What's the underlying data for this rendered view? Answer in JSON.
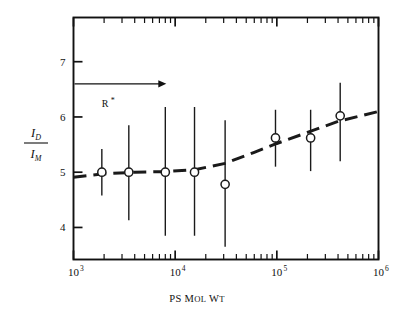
{
  "figure": {
    "background_color": "#ffffff",
    "frame_color": "#111111",
    "data_color": "#1a1a1a"
  },
  "annotation": {
    "label": "R",
    "star": "*",
    "arrow_name": "rightward-arrow"
  },
  "axes": {
    "x": {
      "title_lead": "PS",
      "title_word2_cap": "M",
      "title_word2_rest": "OL",
      "title_word3_cap": "W",
      "title_word3_rest": "T",
      "tick_labels": [
        "10",
        "10",
        "10",
        "10"
      ],
      "tick_exponents": [
        "3",
        "4",
        "5",
        "6"
      ],
      "tick_values": [
        1000,
        10000,
        100000,
        1000000
      ],
      "scale": "log",
      "range": [
        1000,
        1000000
      ]
    },
    "y": {
      "title_numerator_base": "I",
      "title_numerator_sub": "D",
      "title_denominator_base": "I",
      "title_denominator_sub": "M",
      "tick_labels": [
        "4",
        "5",
        "6",
        "7"
      ],
      "tick_values": [
        4,
        5,
        6,
        7
      ],
      "scale": "linear",
      "range": [
        3.42,
        7.8
      ]
    }
  },
  "chart_data": {
    "type": "scatter",
    "title": "",
    "xlabel": "PS MOL WT",
    "ylabel": "I_D / I_M",
    "xscale": "log",
    "yscale": "linear",
    "xlim": [
      1000,
      1000000
    ],
    "ylim": [
      3.42,
      7.8
    ],
    "grid": false,
    "legend": null,
    "marker": "open-circle",
    "errorbar_style": "plain-vertical-no-caps",
    "annotations": [
      {
        "text": "R*",
        "type": "arrow-label",
        "x": 2000,
        "y": 6.6,
        "arrow_to_x": 8000
      }
    ],
    "series": [
      {
        "name": "I_D/I_M vs PS Mol Wt",
        "points": [
          {
            "x": 1900,
            "y": 5.0,
            "yerr_low": 4.58,
            "yerr_high": 5.42
          },
          {
            "x": 3500,
            "y": 5.0,
            "yerr_low": 4.13,
            "yerr_high": 5.85
          },
          {
            "x": 8000,
            "y": 5.0,
            "yerr_low": 3.85,
            "yerr_high": 6.18
          },
          {
            "x": 15500,
            "y": 5.0,
            "yerr_low": 3.85,
            "yerr_high": 6.18
          },
          {
            "x": 31000,
            "y": 4.78,
            "yerr_low": 3.65,
            "yerr_high": 5.94
          },
          {
            "x": 97000,
            "y": 5.62,
            "yerr_low": 5.1,
            "yerr_high": 6.13
          },
          {
            "x": 215000,
            "y": 5.62,
            "yerr_low": 5.02,
            "yerr_high": 6.13
          },
          {
            "x": 420000,
            "y": 6.02,
            "yerr_low": 5.2,
            "yerr_high": 6.62
          }
        ]
      }
    ],
    "fit_curve": {
      "name": "dashed-trend-line",
      "style": "dashed",
      "points": [
        {
          "x": 1000,
          "y": 4.91
        },
        {
          "x": 2000,
          "y": 4.97
        },
        {
          "x": 4000,
          "y": 5.0
        },
        {
          "x": 8000,
          "y": 5.01
        },
        {
          "x": 16000,
          "y": 5.05
        },
        {
          "x": 31000,
          "y": 5.16
        },
        {
          "x": 60000,
          "y": 5.36
        },
        {
          "x": 100000,
          "y": 5.52
        },
        {
          "x": 200000,
          "y": 5.72
        },
        {
          "x": 400000,
          "y": 5.92
        },
        {
          "x": 1000000,
          "y": 6.1
        }
      ]
    }
  }
}
